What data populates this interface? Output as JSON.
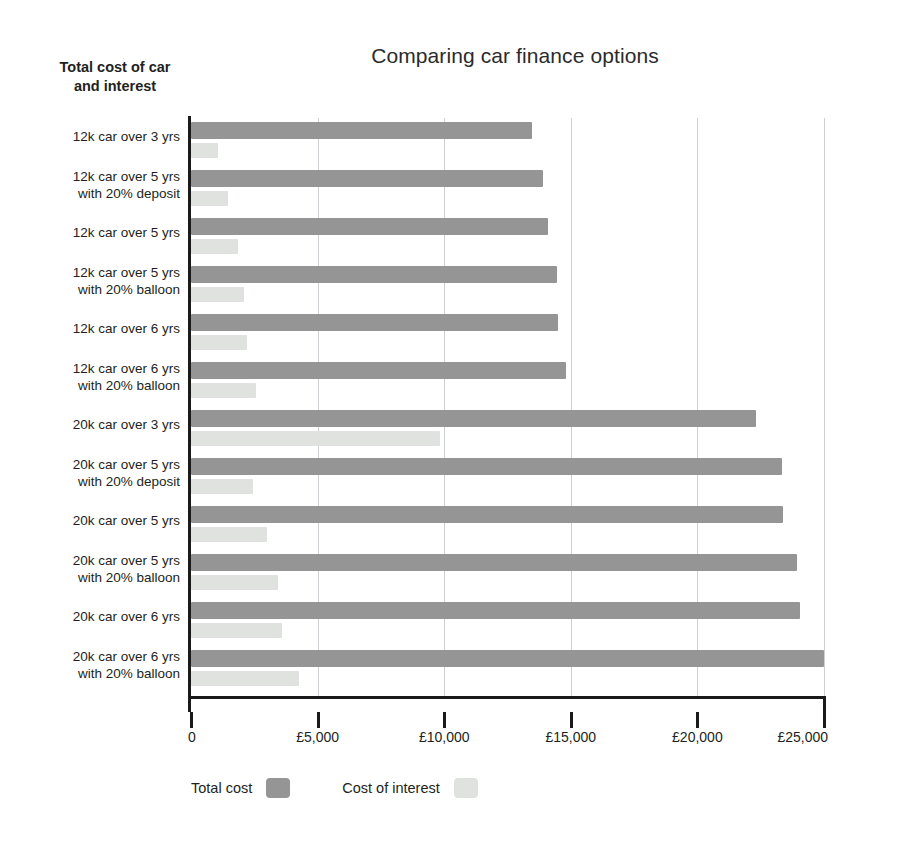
{
  "header": {
    "title": "Comparing car finance options",
    "y_axis_title_line1": "Total cost of car",
    "y_axis_title_line2": "and interest"
  },
  "legend": {
    "items": [
      {
        "label": "Total cost",
        "color": "#959595",
        "swatch_name": "legend-swatch-total-cost"
      },
      {
        "label": "Cost of interest",
        "color": "#dfe2df",
        "swatch_name": "legend-swatch-cost-of-interest"
      }
    ]
  },
  "axis": {
    "x_tick_labels": [
      "0",
      "£5,000",
      "£10,000",
      "£15,000",
      "£20,000",
      "£25,000"
    ],
    "x_tick_values": [
      0,
      5000,
      10000,
      15000,
      20000,
      25000
    ]
  },
  "chart_data": {
    "type": "bar",
    "orientation": "horizontal",
    "title": "Comparing car finance options",
    "xlabel": "",
    "ylabel": "Total cost of car and interest",
    "xlim": [
      0,
      25000
    ],
    "xticks": [
      0,
      5000,
      10000,
      15000,
      20000,
      25000
    ],
    "xtick_labels": [
      "0",
      "£5,000",
      "£10,000",
      "£15,000",
      "£20,000",
      "£25,000"
    ],
    "grid": true,
    "grid_axis": "x",
    "legend_position": "bottom-left",
    "currency": "GBP",
    "categories": [
      "12k car over 3 yrs",
      "12k car over 5 yrs with 20% deposit",
      "12k car over 5 yrs",
      "12k car over 5 yrs with 20% balloon",
      "12k car over 6 yrs",
      "12k car over 6 yrs with 20% balloon",
      "20k car over 3 yrs",
      "20k car over 5 yrs with 20% deposit",
      "20k car over 5 yrs",
      "20k car over 5 yrs with 20% balloon",
      "20k car over 6 yrs",
      "20k car over 6 yrs with 20% balloon"
    ],
    "category_lines": [
      [
        "12k car over 3 yrs",
        ""
      ],
      [
        "12k car over 5 yrs",
        "with 20% deposit"
      ],
      [
        "12k car over 5 yrs",
        ""
      ],
      [
        "12k car over 5 yrs",
        "with 20% balloon"
      ],
      [
        "12k car over 6 yrs",
        ""
      ],
      [
        "12k car over 6 yrs",
        "with 20% balloon"
      ],
      [
        "20k car over 3 yrs",
        ""
      ],
      [
        "20k car over 5 yrs",
        "with 20% deposit"
      ],
      [
        "20k car over 5 yrs",
        ""
      ],
      [
        "20k car over 5 yrs",
        "with 20% balloon"
      ],
      [
        "20k car over 6 yrs",
        ""
      ],
      [
        "20k car over 6 yrs",
        "with 20% balloon"
      ]
    ],
    "series": [
      {
        "name": "Total cost",
        "color": "#959595",
        "values": [
          13450,
          13900,
          14100,
          14450,
          14500,
          14800,
          22300,
          23350,
          23400,
          23950,
          24050,
          25000
        ]
      },
      {
        "name": "Cost of interest",
        "color": "#dfe2df",
        "values": [
          1050,
          1450,
          1850,
          2100,
          2200,
          2550,
          9850,
          2450,
          3000,
          3450,
          3600,
          4250
        ]
      }
    ]
  }
}
